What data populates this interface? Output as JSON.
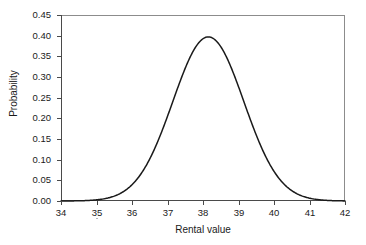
{
  "chart_data": {
    "type": "line",
    "title": "",
    "subtitle": "",
    "xlabel": "Rental value",
    "ylabel": "Probability",
    "xlim": [
      34,
      42
    ],
    "ylim": [
      0.0,
      0.45
    ],
    "xticks": [
      34,
      35,
      36,
      37,
      38,
      39,
      40,
      41,
      42
    ],
    "xtick_labels": [
      "34",
      "35",
      "36",
      "37",
      "38",
      "39",
      "40",
      "41",
      "42"
    ],
    "yticks": [
      0.0,
      0.05,
      0.1,
      0.15,
      0.2,
      0.25,
      0.3,
      0.35,
      0.4,
      0.45
    ],
    "ytick_labels": [
      "0.00",
      "0.05",
      "0.10",
      "0.15",
      "0.20",
      "0.25",
      "0.30",
      "0.35",
      "0.40",
      "0.45"
    ],
    "grid": false,
    "legend": null,
    "legend_position": "none",
    "line_color": "#1a1a1a",
    "frame_color": "#8c8c8c",
    "background_color": "#ffffff",
    "distribution": {
      "kind": "normal",
      "mean": 38.15,
      "sigma": 1.0,
      "peak_x": 38.15,
      "peak_y": 0.397
    },
    "series": [
      {
        "name": "Probability density",
        "x": [
          34.0,
          34.2,
          34.4,
          34.6,
          34.8,
          35.0,
          35.2,
          35.4,
          35.6,
          35.8,
          36.0,
          36.2,
          36.4,
          36.6,
          36.8,
          37.0,
          37.2,
          37.4,
          37.6,
          37.8,
          38.0,
          38.15,
          38.2,
          38.4,
          38.6,
          38.8,
          39.0,
          39.2,
          39.4,
          39.6,
          39.8,
          40.0,
          40.2,
          40.4,
          40.6,
          40.8,
          41.0,
          41.2,
          41.4,
          41.6,
          41.8,
          42.0
        ],
        "values": [
          0.0,
          0.001,
          0.001,
          0.002,
          0.004,
          0.006,
          0.01,
          0.016,
          0.024,
          0.035,
          0.05,
          0.069,
          0.092,
          0.119,
          0.15,
          0.184,
          0.219,
          0.254,
          0.288,
          0.318,
          0.344,
          0.397,
          0.396,
          0.387,
          0.37,
          0.345,
          0.314,
          0.279,
          0.242,
          0.205,
          0.17,
          0.138,
          0.109,
          0.084,
          0.063,
          0.046,
          0.033,
          0.023,
          0.016,
          0.01,
          0.006,
          0.004
        ]
      }
    ]
  }
}
